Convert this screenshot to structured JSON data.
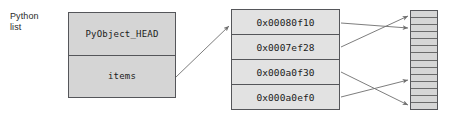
{
  "diagram": {
    "title_label": "Python\nlist",
    "line_color": "#6e6e6e",
    "border_color": "#55565a",
    "box_fill": "#d5d5d5",
    "array_fill": "#e2e2e2",
    "grid_fill": "#d6d6d6"
  },
  "list_object": {
    "cells": [
      {
        "label": "PyObject_HEAD"
      },
      {
        "label": "items"
      }
    ]
  },
  "pointer_array": {
    "cells": [
      {
        "address": "0x00080f10"
      },
      {
        "address": "0x0007ef28"
      },
      {
        "address": "0x000a0f30"
      },
      {
        "address": "0x000a0ef0"
      }
    ]
  },
  "memory_grid": {
    "row_count": 14,
    "rows": [
      {},
      {},
      {},
      {},
      {},
      {},
      {},
      {},
      {},
      {},
      {},
      {},
      {},
      {}
    ]
  },
  "connections": {
    "items_to_array": {
      "from": "items",
      "to": "pointer-array-cell-0"
    },
    "pointer_links": [
      {
        "from": "pointer-array-cell-0",
        "to": "memory-row-2"
      },
      {
        "from": "pointer-array-cell-1",
        "to": "memory-row-0"
      },
      {
        "from": "pointer-array-cell-2",
        "to": "memory-row-13"
      },
      {
        "from": "pointer-array-cell-3",
        "to": "memory-row-9"
      }
    ]
  }
}
